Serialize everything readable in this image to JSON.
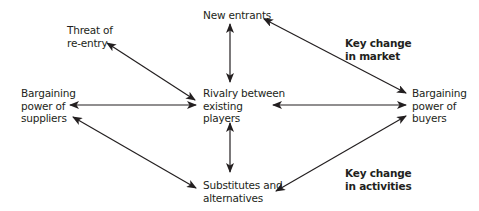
{
  "diagram": {
    "nodes": {
      "threat": {
        "lines": [
          "Threat of",
          "re-entry"
        ]
      },
      "new_entrants": {
        "lines": [
          "New entrants"
        ]
      },
      "suppliers": {
        "lines": [
          "Bargaining",
          "power of",
          "suppliers"
        ]
      },
      "rivalry": {
        "lines": [
          "Rivalry between",
          "existing",
          "players"
        ]
      },
      "buyers": {
        "lines": [
          "Bargaining",
          "power of",
          "buyers"
        ]
      },
      "substitutes": {
        "lines": [
          "Substitutes and",
          "alternatives"
        ]
      }
    },
    "annotations": {
      "market": {
        "lines": [
          "Key change",
          "in market"
        ]
      },
      "activities": {
        "lines": [
          "Key change",
          "in activities"
        ]
      }
    },
    "edges": [
      {
        "from": "threat",
        "to": "rivalry",
        "type": "bidirectional"
      },
      {
        "from": "new_entrants",
        "to": "rivalry",
        "type": "bidirectional"
      },
      {
        "from": "new_entrants",
        "to": "buyers",
        "type": "bidirectional"
      },
      {
        "from": "suppliers",
        "to": "rivalry",
        "type": "bidirectional"
      },
      {
        "from": "rivalry",
        "to": "buyers",
        "type": "bidirectional"
      },
      {
        "from": "rivalry",
        "to": "substitutes",
        "type": "bidirectional"
      },
      {
        "from": "suppliers",
        "to": "substitutes",
        "type": "bidirectional"
      },
      {
        "from": "substitutes",
        "to": "buyers",
        "type": "bidirectional"
      }
    ],
    "colors": {
      "line": "#231f20",
      "text": "#231f20",
      "background": "#ffffff"
    }
  }
}
